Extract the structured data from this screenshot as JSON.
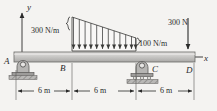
{
  "figure": {
    "kind": "beam-free-body-diagram",
    "background_color": "#f4f3f1",
    "beam_color": "#c9c8c6",
    "line_color": "#2a2a2a"
  },
  "axes": {
    "y_label": "y",
    "x_label": "x"
  },
  "points": {
    "A": "A",
    "B": "B",
    "C": "C",
    "D": "D"
  },
  "loads": {
    "distributed_left_label": "300 N/m",
    "distributed_right_label": "100 N/m",
    "point_load_label": "300 N",
    "distributed_left_value": 300,
    "distributed_right_value": 100,
    "point_load_value": 300,
    "distributed_arrow_count": 12
  },
  "dimensions": {
    "segments": [
      {
        "label": "6 m",
        "value": 6
      },
      {
        "label": "6 m",
        "value": 6
      },
      {
        "label": "6 m",
        "value": 6
      }
    ]
  },
  "supports": {
    "A": "pin-support",
    "C": "roller-support"
  }
}
